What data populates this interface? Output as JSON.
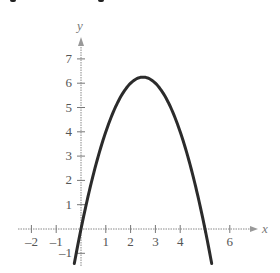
{
  "chart_data": {
    "type": "line",
    "title": "",
    "xlabel": "x",
    "ylabel": "y",
    "xlim": [
      -2.3,
      7
    ],
    "ylim": [
      -1.4,
      7.8
    ],
    "x_ticks": [
      -2,
      -1,
      1,
      2,
      3,
      4,
      5,
      6
    ],
    "x_tick_labels": [
      "-2",
      "-1",
      "1",
      "2",
      "3",
      "4",
      "",
      "6"
    ],
    "y_ticks": [
      -1,
      1,
      2,
      3,
      4,
      5,
      6,
      7
    ],
    "y_tick_labels": [
      "-1",
      "1",
      "2",
      "3",
      "4",
      "5",
      "6",
      "7"
    ],
    "grid": false,
    "series": [
      {
        "name": "y = 5x - x^2",
        "color": "#2b2b2b",
        "x": [
          -0.27,
          0,
          0.5,
          1,
          1.5,
          2,
          2.5,
          3,
          3.5,
          4,
          4.5,
          5,
          5.27
        ],
        "y": [
          -1.42,
          0,
          2.25,
          4,
          5.25,
          6,
          6.25,
          6,
          5.25,
          4,
          2.25,
          0,
          -1.42
        ]
      }
    ],
    "annotations": []
  },
  "labels": {
    "x_axis": "x",
    "y_axis": "y"
  }
}
